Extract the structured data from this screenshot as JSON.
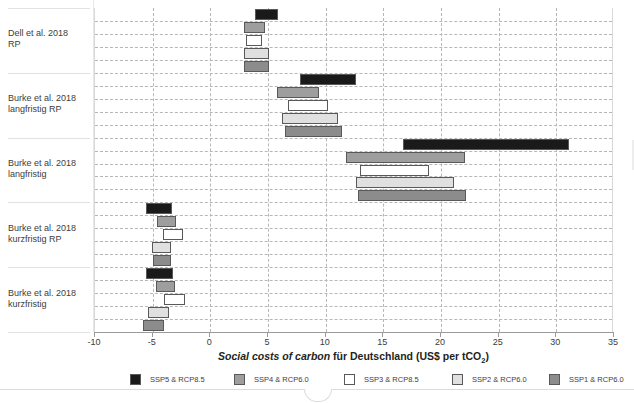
{
  "chart_data": {
    "type": "bar",
    "orientation": "horizontal",
    "subtype": "floating-range-bars",
    "title": "",
    "xlabel": "Social costs of carbon für Deutschland  (US$ per tCO2)",
    "xlabel_parts": {
      "italic": "Social costs of carbon",
      "plain": " für Deutschland ",
      "unit_prefix": " (US$ per tCO",
      "unit_sub": "2",
      "unit_suffix": ")"
    },
    "ylabel": "",
    "xlim": [
      -10,
      35
    ],
    "xticks": [
      -10,
      -5,
      0,
      5,
      10,
      15,
      20,
      25,
      30,
      35
    ],
    "xticklabels": [
      "-10",
      "-5",
      "0",
      "5",
      "10",
      "15",
      "20",
      "25",
      "30",
      "35"
    ],
    "grid": "dashed-both",
    "legend_position": "bottom",
    "categories": [
      "Dell et al. 2018 RP",
      "Burke et al. 2018 langfristig RP",
      "Burke et al. 2018 langfristig",
      "Burke et al. 2018 kurzfristig RP",
      "Burke et al. 2018 kurzfristig"
    ],
    "category_labels": [
      {
        "line1": "Dell et al. 2018",
        "line2": "RP"
      },
      {
        "line1": "Burke et al. 2018",
        "line2": "langfristig RP"
      },
      {
        "line1": "Burke et al. 2018",
        "line2": "langfristig"
      },
      {
        "line1": "Burke et al. 2018",
        "line2": "kurzfristig RP"
      },
      {
        "line1": "Burke et al. 2018",
        "line2": "kurzfristig"
      }
    ],
    "series": [
      {
        "name": "SSP5 & RCP8.5",
        "color": "#1a1a1a",
        "ranges": [
          [
            3.9,
            5.9
          ],
          [
            7.8,
            12.6
          ],
          [
            16.7,
            31.1
          ],
          [
            -5.6,
            -3.3
          ],
          [
            -5.6,
            -3.2
          ]
        ]
      },
      {
        "name": "SSP4 & RCP6.0",
        "color": "#9e9e9e",
        "ranges": [
          [
            2.9,
            4.7
          ],
          [
            5.8,
            9.4
          ],
          [
            11.8,
            22.1
          ],
          [
            -4.6,
            -3.0
          ],
          [
            -4.7,
            -3.1
          ]
        ]
      },
      {
        "name": "SSP3 & RCP8.5",
        "color": "#ffffff",
        "ranges": [
          [
            3.1,
            4.5
          ],
          [
            6.7,
            10.2
          ],
          [
            13.0,
            19.0
          ],
          [
            -4.1,
            -2.4
          ],
          [
            -4.0,
            -2.2
          ]
        ]
      },
      {
        "name": "SSP2 & RCP6.0",
        "color": "#e0e0e0",
        "ranges": [
          [
            2.9,
            5.1
          ],
          [
            6.2,
            11.1
          ],
          [
            12.6,
            21.1
          ],
          [
            -5.1,
            -3.4
          ],
          [
            -5.4,
            -3.6
          ]
        ]
      },
      {
        "name": "SSP1 & RCP6.0",
        "color": "#8c8c8c",
        "ranges": [
          [
            2.9,
            5.1
          ],
          [
            6.5,
            11.4
          ],
          [
            12.8,
            22.2
          ],
          [
            -5.0,
            -3.4
          ],
          [
            -5.8,
            -4.0
          ]
        ]
      }
    ],
    "legend_entries": [
      {
        "label": "SSP5 & RCP8.5",
        "color": "#1a1a1a"
      },
      {
        "label": "SSP4 & RCP6.0",
        "color": "#9e9e9e"
      },
      {
        "label": "SSP3 & RCP8.5",
        "color": "#ffffff"
      },
      {
        "label": "SSP2 & RCP6.0",
        "color": "#e0e0e0"
      },
      {
        "label": "SSP1 & RCP6.0",
        "color": "#8c8c8c"
      }
    ]
  }
}
